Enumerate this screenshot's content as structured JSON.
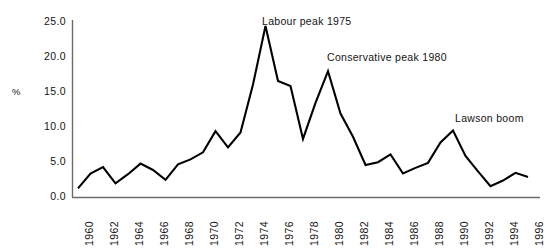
{
  "chart_data": {
    "type": "line",
    "title": "",
    "xlabel": "",
    "ylabel": "%",
    "xlim": [
      1960,
      1996
    ],
    "ylim": [
      0.0,
      25.0
    ],
    "grid": false,
    "legend": "none",
    "line_color": "#000000",
    "axis_color": "#6b6b6b",
    "ytick_labels": [
      "25.0",
      "20.0",
      "15.0",
      "10.0",
      "5.0",
      "0.0"
    ],
    "ytick_values": [
      25.0,
      20.0,
      15.0,
      10.0,
      5.0,
      0.0
    ],
    "xtick_labels": [
      "1960",
      "1962",
      "1964",
      "1966",
      "1968",
      "1970",
      "1972",
      "1974",
      "1976",
      "1978",
      "1980",
      "1982",
      "1984",
      "1986",
      "1988",
      "1990",
      "1992",
      "1994",
      "1996"
    ],
    "xtick_values": [
      1960,
      1962,
      1964,
      1966,
      1968,
      1970,
      1972,
      1974,
      1976,
      1978,
      1980,
      1982,
      1984,
      1986,
      1988,
      1990,
      1992,
      1994,
      1996
    ],
    "x": [
      1960,
      1961,
      1962,
      1963,
      1964,
      1965,
      1966,
      1967,
      1968,
      1969,
      1970,
      1971,
      1972,
      1973,
      1974,
      1975,
      1976,
      1977,
      1978,
      1979,
      1980,
      1981,
      1982,
      1983,
      1984,
      1985,
      1986,
      1987,
      1988,
      1989,
      1990,
      1991,
      1992,
      1993,
      1994,
      1995,
      1996
    ],
    "values": [
      1.3,
      3.4,
      4.3,
      2.0,
      3.3,
      4.8,
      3.9,
      2.5,
      4.7,
      5.4,
      6.4,
      9.4,
      7.1,
      9.2,
      16.0,
      24.3,
      16.5,
      15.8,
      8.3,
      13.4,
      17.9,
      11.9,
      8.6,
      4.6,
      5.0,
      6.1,
      3.4,
      4.2,
      4.9,
      7.8,
      9.5,
      5.9,
      3.7,
      1.6,
      2.4,
      3.5,
      2.9
    ],
    "annotations": [
      {
        "text": "Labour peak 1975",
        "x_px": 262,
        "y_px": 15
      },
      {
        "text": "Conservative peak 1980",
        "x_px": 327,
        "y_px": 51
      },
      {
        "text": "Lawson boom",
        "x_px": 455,
        "y_px": 112
      }
    ]
  }
}
